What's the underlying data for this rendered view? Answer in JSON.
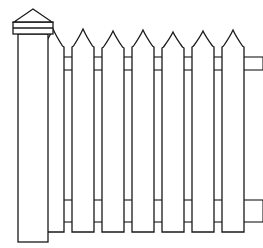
{
  "figure": {
    "style": "black-and-white line art",
    "width": 263,
    "height": 248,
    "background_color": "#ffffff",
    "line_color": "#1a1a1a",
    "fill_color": "#ffffff",
    "line_width": 1.3,
    "rail_line_width": 1.1
  },
  "post": {
    "name": "corner-post",
    "x_left": 18,
    "x_right": 48,
    "y_top": 34,
    "y_bottom": 242,
    "cap": {
      "name": "pyramidal-post-cap",
      "apex_x": 33,
      "apex_y": 9,
      "base_left_x": 14,
      "base_right_x": 52,
      "base_y": 22,
      "collar": {
        "name": "post-collar-bands",
        "x_left": 13,
        "x_right": 53,
        "y_top": 22,
        "y_bottom": 34,
        "band_divider_y": 28
      }
    }
  },
  "rails": {
    "count": 2,
    "x_start": 48,
    "x_end": 263,
    "items": [
      {
        "name": "top-rail",
        "y_top": 57,
        "y_bottom": 70
      },
      {
        "name": "bottom-rail",
        "y_top": 200,
        "y_bottom": 222
      }
    ]
  },
  "pickets": {
    "count": 7,
    "width": 22,
    "y_shoulder": 46,
    "y_bottom": 232,
    "tip_half_width": 3,
    "apex_offset": 36,
    "items": [
      {
        "name": "picket-1",
        "x_left": 42,
        "apex_y": 29,
        "shoulder_y": 47
      },
      {
        "name": "picket-2",
        "x_left": 72,
        "apex_y": 29,
        "shoulder_y": 47
      },
      {
        "name": "picket-3",
        "x_left": 102,
        "apex_y": 31,
        "shoulder_y": 48
      },
      {
        "name": "picket-4",
        "x_left": 132,
        "apex_y": 30,
        "shoulder_y": 47
      },
      {
        "name": "picket-5",
        "x_left": 162,
        "apex_y": 32,
        "shoulder_y": 48
      },
      {
        "name": "picket-6",
        "x_left": 192,
        "apex_y": 31,
        "shoulder_y": 47
      },
      {
        "name": "picket-7",
        "x_left": 222,
        "apex_y": 30,
        "shoulder_y": 47
      }
    ]
  }
}
